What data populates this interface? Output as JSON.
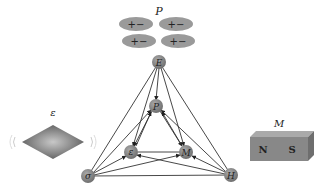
{
  "labels": {
    "polarization_title": "P",
    "permittivity_title": "ε",
    "magnet_title": "M",
    "magnet_north": "N",
    "magnet_south": "S"
  },
  "dipoles": [
    {
      "text": "+−"
    },
    {
      "text": "+−"
    },
    {
      "text": "+−"
    },
    {
      "text": "+−"
    }
  ],
  "nodes": {
    "E": {
      "label": "E",
      "x": 159,
      "y": 62
    },
    "P": {
      "label": "P",
      "x": 156,
      "y": 106
    },
    "eps": {
      "label": "ε",
      "x": 131,
      "y": 152
    },
    "M": {
      "label": "M",
      "x": 186,
      "y": 152
    },
    "sigma": {
      "label": "σ",
      "x": 88,
      "y": 176
    },
    "H": {
      "label": "H",
      "x": 231,
      "y": 175
    }
  },
  "colors": {
    "node_fill": "#8a8a8a",
    "edge": "#333333",
    "dipole_fill": "#9a9a9a",
    "diamond": "#6f6f6f",
    "magnet": "#888888"
  }
}
